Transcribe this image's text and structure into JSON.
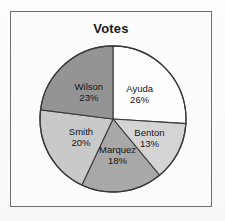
{
  "chart_data": {
    "type": "pie",
    "title": "Votes",
    "xlabel": "",
    "ylabel": "",
    "legend": "none",
    "labels_inside_slices": true,
    "start_angle_deg": 0,
    "direction": "clockwise",
    "categories": [
      "Ayuda",
      "Benton",
      "Marquez",
      "Smith",
      "Wilson"
    ],
    "values": [
      26,
      13,
      18,
      20,
      23
    ],
    "value_unit": "%",
    "slices": [
      {
        "label": "Ayuda",
        "value": 26,
        "value_text": "26%",
        "color": "#fdfdfd"
      },
      {
        "label": "Benton",
        "value": 13,
        "value_text": "13%",
        "color": "#d4d4d4"
      },
      {
        "label": "Marquez",
        "value": 18,
        "value_text": "18%",
        "color": "#a8a8a8"
      },
      {
        "label": "Smith",
        "value": 20,
        "value_text": "20%",
        "color": "#c9c9c9"
      },
      {
        "label": "Wilson",
        "value": 23,
        "value_text": "23%",
        "color": "#949494"
      }
    ]
  },
  "chart": {
    "title": "Votes",
    "frame_color": "#6e6e6e",
    "outline_color": "#3a3a3a",
    "background": "#fcfcfc"
  }
}
